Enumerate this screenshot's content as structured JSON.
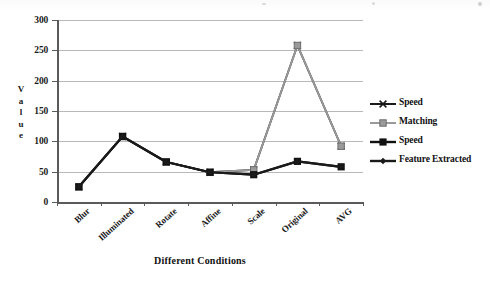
{
  "chart_data": {
    "type": "line",
    "title": "",
    "xlabel": "Different Conditions",
    "ylabel": "Value",
    "categories": [
      "Blur",
      "Illuminated",
      "Rotate",
      "Affine",
      "Scale",
      "Original",
      "AVG"
    ],
    "yticks": [
      0,
      50,
      100,
      150,
      200,
      250,
      300
    ],
    "ylim": [
      0,
      300
    ],
    "grid": true,
    "legend_position": "right",
    "series": [
      {
        "name": "Speed",
        "color": "#1a1a1a",
        "marker": "tick",
        "values": [
          25,
          108,
          66,
          49,
          53,
          258,
          92
        ]
      },
      {
        "name": "Matching",
        "color": "#9a9a9a",
        "marker": "square",
        "values": [
          25,
          108,
          66,
          49,
          53,
          258,
          92
        ]
      },
      {
        "name": "Speed",
        "color": "#111111",
        "marker": "bigsquare",
        "values": [
          25,
          108,
          66,
          49,
          45,
          67,
          58
        ]
      },
      {
        "name": "Feature Extracted",
        "color": "#1a1a1a",
        "marker": "diamond",
        "values": [
          25,
          108,
          66,
          49,
          45,
          67,
          58
        ]
      }
    ]
  },
  "legend": {
    "entries": [
      {
        "label": "Speed"
      },
      {
        "label": "Matching"
      },
      {
        "label": "Speed"
      },
      {
        "label": "Feature Extracted"
      }
    ]
  },
  "axes": {
    "y_title_letters": [
      "V",
      "a",
      "l",
      "u",
      "e"
    ],
    "x_title": "Different Conditions",
    "y_tick_labels": [
      "300",
      "250",
      "200",
      "150",
      "100",
      "50",
      "0"
    ]
  }
}
